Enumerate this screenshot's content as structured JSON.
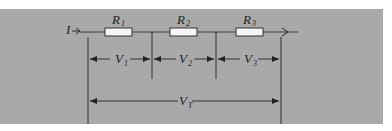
{
  "diagram": {
    "current_label": "I",
    "resistors": [
      {
        "label": "R",
        "subscript": "1"
      },
      {
        "label": "R",
        "subscript": "2"
      },
      {
        "label": "R",
        "subscript": "3"
      }
    ],
    "voltages": [
      {
        "label": "V",
        "subscript": "1"
      },
      {
        "label": "V",
        "subscript": "2"
      },
      {
        "label": "V",
        "subscript": "3"
      }
    ],
    "total_voltage": {
      "label": "V",
      "subscript": "T"
    },
    "colors": {
      "background": "#a9a9a9",
      "line": "#2a2a2a",
      "resistor_fill": "#f4f4f4",
      "page": "#ffffff"
    }
  }
}
